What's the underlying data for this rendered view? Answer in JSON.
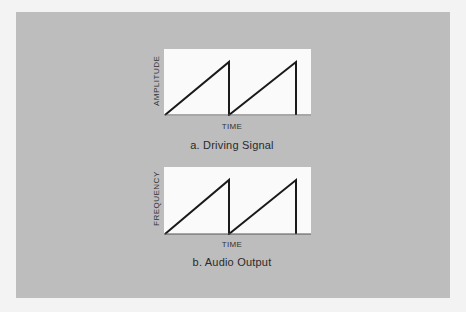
{
  "figure": {
    "colors": {
      "outer_background": "#f3f3f3",
      "panel_background": "#bdbdbd",
      "plot_background": "#fafafa",
      "line_color": "#1a1a1a"
    },
    "diagrams": [
      {
        "id": "a",
        "y_axis_label": "AMPLITUDE",
        "x_axis_label": "TIME",
        "caption": "a. Driving Signal",
        "waveform": "sawtooth",
        "cycles": 2
      },
      {
        "id": "b",
        "y_axis_label": "FREQUENCY",
        "x_axis_label": "TIME",
        "caption": "b. Audio Output",
        "waveform": "sawtooth",
        "cycles": 2
      }
    ]
  }
}
